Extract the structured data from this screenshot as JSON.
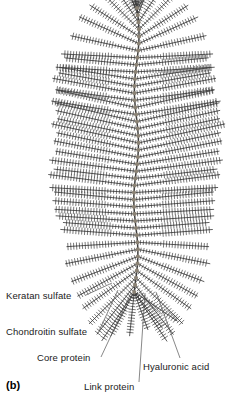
{
  "figure": {
    "panel_letter": "(b)",
    "kind": "proteoglycan-aggregate-diagram",
    "background_color": "#ffffff",
    "ink_color": "#3f3f3f",
    "node_color": "#8a8275",
    "label_color": "#1b1b1b",
    "leader_color": "#555555"
  },
  "labels": {
    "keratan_sulfate": "Keratan sulfate",
    "chondroitin_sulfate": "Chondroitin sulfate",
    "core_protein": "Core protein",
    "link_protein": "Link protein",
    "hyaluronic_acid": "Hyaluronic acid"
  },
  "chart_data": {
    "type": "diagram",
    "subtitle": "Aggrecan monomers bound to a hyaluronic acid backbone",
    "annotations": [
      "Keratan sulfate",
      "Chondroitin sulfate",
      "Core protein",
      "Link protein",
      "Hyaluronic acid"
    ],
    "components": [
      {
        "name": "Hyaluronic acid",
        "role": "central backbone filament",
        "render": "vertical wavy line from top apex to lower fan point",
        "color": "#3f3f3f"
      },
      {
        "name": "Link protein",
        "role": "globular node attaching each core protein to the backbone",
        "render": "small gray-brown beads spaced along the backbone",
        "count": 40,
        "color": "#8a8275"
      },
      {
        "name": "Core protein",
        "role": "protein stem radiating from each link protein",
        "render": "straight line branches left and right of backbone",
        "count": 80,
        "color": "#3f3f3f"
      },
      {
        "name": "Chondroitin sulfate",
        "role": "long glycosaminoglycan bristles on the outer core protein",
        "render": "short perpendicular teeth along outer two-thirds of each branch",
        "color": "#3f3f3f"
      },
      {
        "name": "Keratan sulfate",
        "role": "shorter glycosaminoglycan bristles near the core protein base",
        "render": "short perpendicular teeth along inner third of each branch",
        "color": "#3f3f3f"
      }
    ],
    "layout": {
      "backbone_x": 137,
      "backbone_top_y": 8,
      "backbone_bottom_y": 292,
      "branch_rows": 40,
      "fan_top": true,
      "fan_bottom": true,
      "legend": "leader lines from text labels to structures",
      "grid": false
    }
  }
}
